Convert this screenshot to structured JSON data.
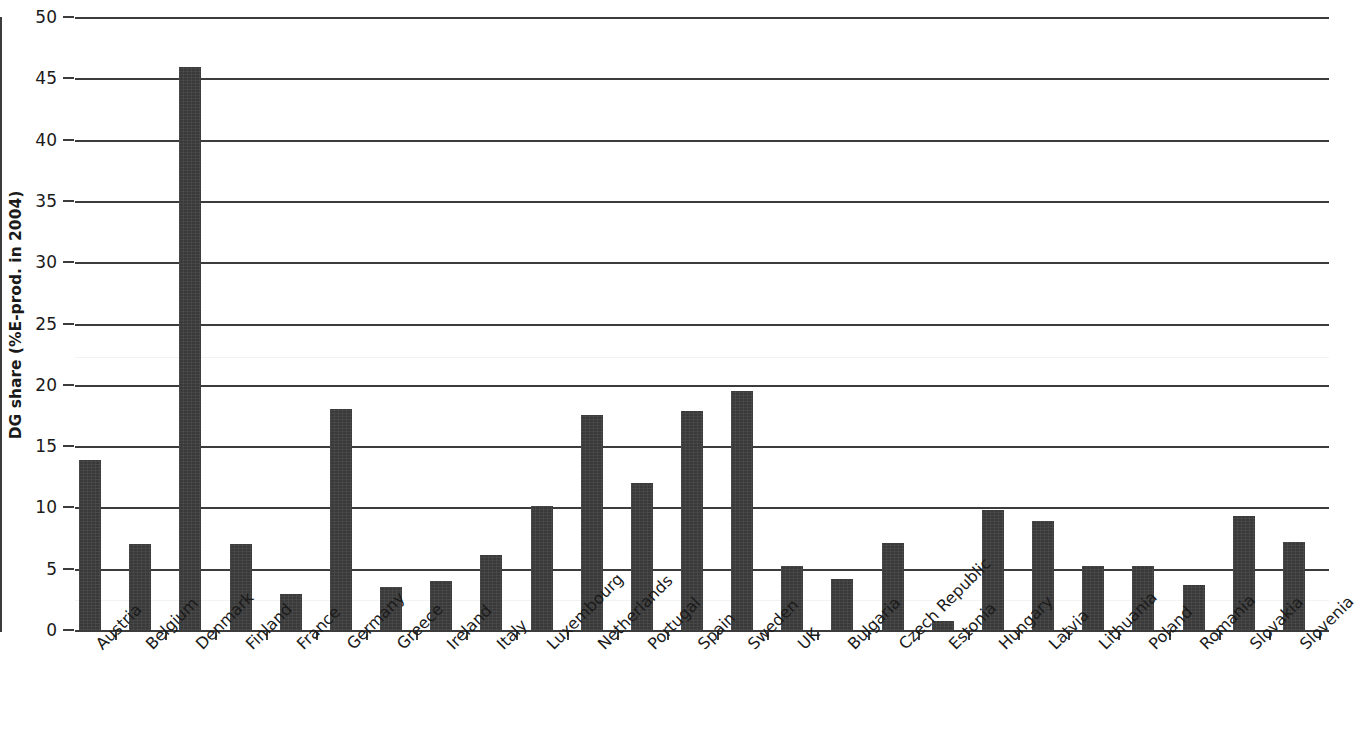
{
  "chart_data": {
    "type": "bar",
    "title": "",
    "subtitle": "",
    "xlabel": "",
    "ylabel": "DG share (%E-prod. in 2004)",
    "ylim": [
      0,
      50
    ],
    "ytick_step": 5,
    "yticks": [
      "0",
      "5",
      "10",
      "15",
      "20",
      "25",
      "30",
      "35",
      "40",
      "45",
      "50"
    ],
    "grid": true,
    "grid_axis": "y",
    "legend": "none",
    "bar_color": "#3a3a3a",
    "axis_color": "#3c3c3c",
    "categories": [
      "Austria",
      "Belgium",
      "Denmark",
      "Finland",
      "France",
      "Germany",
      "Greece",
      "Ireland",
      "Italy",
      "Luxembourg",
      "Netherlands",
      "Portugal",
      "Spain",
      "Sweden",
      "UK",
      "Bulgaria",
      "Czech Republic",
      "Estonia",
      "Hungary",
      "Latvia",
      "Lithuania",
      "Poland",
      "Romania",
      "Slovakia",
      "Slovenia"
    ],
    "values": [
      13.9,
      7.0,
      45.9,
      7.0,
      2.9,
      18.0,
      3.5,
      4.0,
      6.1,
      10.1,
      17.5,
      12.0,
      17.9,
      19.5,
      5.2,
      4.2,
      7.1,
      0.7,
      9.8,
      8.9,
      5.2,
      5.2,
      3.7,
      9.3,
      7.2
    ]
  }
}
